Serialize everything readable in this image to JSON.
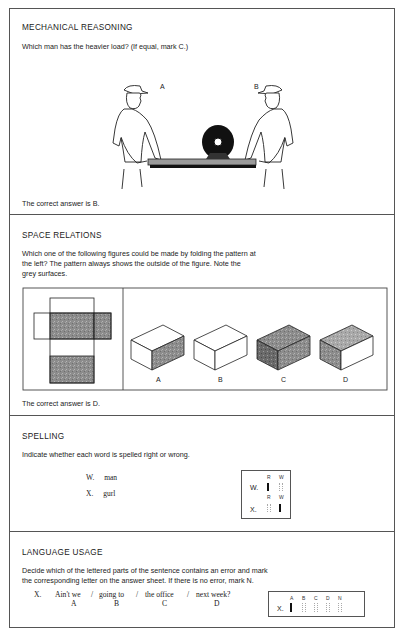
{
  "sections": [
    {
      "id": "mechanical",
      "heading": "MECHANICAL REASONING",
      "prompt": "Which man has the heavier load?  (If equal, mark C.)",
      "figure": {
        "labels": [
          "A",
          "B"
        ],
        "description": "Two workmen carrying a plank with a heavy roll placed closer to man B"
      },
      "answer": "The correct answer is B."
    },
    {
      "id": "space",
      "heading": "SPACE RELATIONS",
      "prompt_lines": [
        "Which one of the following figures could be made by folding the pattern at",
        "the left?  The pattern always shows the outside of the figure.  Note the",
        "grey surfaces."
      ],
      "options": [
        {
          "label": "A",
          "shading": "front-right face grey"
        },
        {
          "label": "B",
          "shading": "all faces white"
        },
        {
          "label": "C",
          "shading": "all faces grey"
        },
        {
          "label": "D",
          "shading": "top and left faces grey"
        }
      ],
      "answer": "The correct answer is D."
    },
    {
      "id": "spelling",
      "heading": "SPELLING",
      "prompt": "Indicate whether each word is spelled right or wrong.",
      "items": [
        {
          "letter": "W.",
          "word": "man"
        },
        {
          "letter": "X.",
          "word": "gurl"
        }
      ],
      "answer_sheet": {
        "columns": [
          "R",
          "W"
        ],
        "rows": [
          {
            "letter": "W.",
            "marked": "R"
          },
          {
            "letter": "X.",
            "marked": "W"
          }
        ]
      }
    },
    {
      "id": "language",
      "heading": "LANGUAGE USAGE",
      "prompt_lines": [
        "Decide which of the lettered parts of the sentence contains an error and mark",
        "the corresponding letter on the answer sheet.  If there is no error, mark N."
      ],
      "item_letter": "X.",
      "parts": [
        {
          "text": "Ain't we",
          "letter": "A"
        },
        {
          "text": "going to",
          "letter": "B"
        },
        {
          "text": "the office",
          "letter": "C"
        },
        {
          "text": "next week?",
          "letter": "D"
        }
      ],
      "separator": "/",
      "answer_sheet": {
        "columns": [
          "A",
          "B",
          "C",
          "D",
          "N"
        ],
        "row_letter": "X.",
        "marked": "A"
      }
    }
  ]
}
